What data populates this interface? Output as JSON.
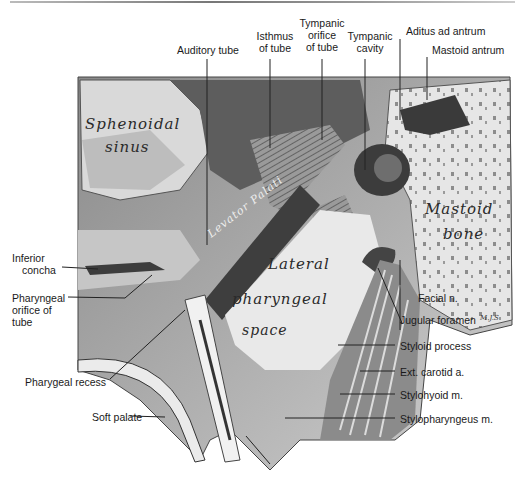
{
  "figure": {
    "signature": "M.J.S",
    "internal_labels": {
      "sphenoidal_sinus_1": "Sphenoidal",
      "sphenoidal_sinus_2": "sinus",
      "levator_palati": "Levator Palati",
      "lateral_1": "Lateral",
      "lateral_2": "pharyngeal",
      "lateral_3": "space",
      "mastoid_1": "Mastoid",
      "mastoid_2": "bone"
    },
    "labels": {
      "auditory_tube": "Auditory tube",
      "isthmus_1": "Isthmus",
      "isthmus_2": "of tube",
      "tympanic_orifice_1": "Tympanic",
      "tympanic_orifice_2": "orifice",
      "tympanic_orifice_3": "of tube",
      "tympanic_cavity_1": "Tympanic",
      "tympanic_cavity_2": "cavity",
      "aditus": "Aditus ad antrum",
      "mastoid_antrum": "Mastoid antrum",
      "inferior_concha_1": "Inferior",
      "inferior_concha_2": "concha",
      "pharyngeal_orifice_1": "Pharyngeal",
      "pharyngeal_orifice_2": "orifice of",
      "pharyngeal_orifice_3": "tube",
      "pharygeal_recess": "Pharygeal recess",
      "soft_palate": "Soft palate",
      "facial_n": "Facial n.",
      "jugular_foramen": "Jugular foramen",
      "styloid_process": "Styloid process",
      "ext_carotid": "Ext. carotid a.",
      "stylohyoid": "Stylohyoid m.",
      "stylopharyngeus": "Stylopharyngeus m."
    }
  }
}
